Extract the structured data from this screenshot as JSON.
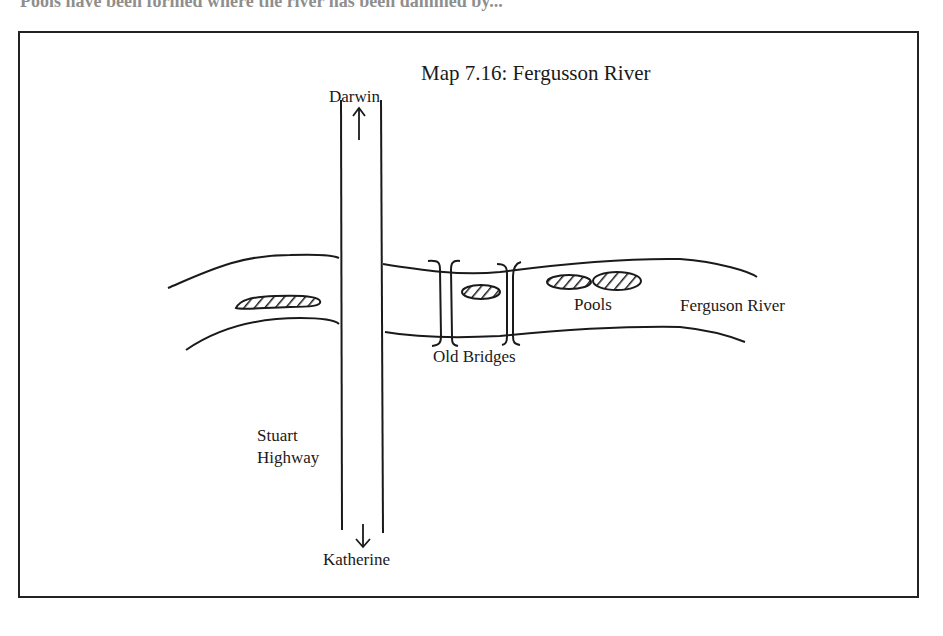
{
  "page": {
    "cut_off_text": "Pools have been formed where the river has been dammed by..."
  },
  "map": {
    "title": "Map 7.16:  Fergusson River",
    "labels": {
      "north": "Darwin",
      "south": "Katherine",
      "highway": [
        "Stuart",
        "Highway"
      ],
      "bridges": "Old Bridges",
      "pools": "Pools",
      "river": "Ferguson River"
    },
    "symbols": {
      "north_arrow": "↑",
      "south_arrow": "↓"
    },
    "colors": {
      "ink": "#1a1a1a",
      "background": "#ffffff"
    }
  }
}
